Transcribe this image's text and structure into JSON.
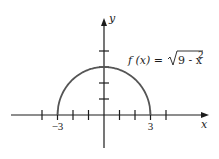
{
  "chart_data": {
    "type": "line",
    "title": "",
    "function_label": "f (x) = √9 - x²",
    "function_parts": {
      "lhs": "f (x) = ",
      "radicand": "9 - x",
      "exponent": "2"
    },
    "xlabel": "x",
    "ylabel": "y",
    "x_ticks": [
      -4,
      -3,
      -2,
      -1,
      1,
      2,
      3,
      4
    ],
    "x_tick_labels": [
      {
        "value": -3,
        "label": "−3"
      },
      {
        "value": 3,
        "label": "3"
      }
    ],
    "y_ticks": [
      1,
      2,
      3,
      4
    ],
    "xlim": [
      -6,
      6.6
    ],
    "ylim": [
      -2,
      6
    ],
    "grid": false,
    "series": [
      {
        "name": "f(x) = sqrt(9 - x^2)",
        "x": [
          -3,
          -2.5,
          -2,
          -1.5,
          -1,
          -0.5,
          0,
          0.5,
          1,
          1.5,
          2,
          2.5,
          3
        ],
        "y": [
          0,
          1.66,
          2.24,
          2.6,
          2.83,
          2.96,
          3,
          2.96,
          2.83,
          2.6,
          2.24,
          1.66,
          0
        ]
      }
    ],
    "colors": {
      "axis": "#1c1c1c",
      "curve": "#555555"
    }
  }
}
